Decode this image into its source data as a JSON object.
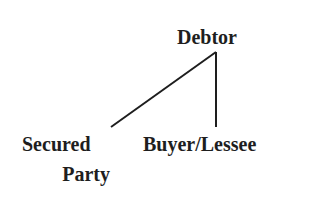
{
  "diagram": {
    "type": "tree",
    "root": {
      "label": "Debtor"
    },
    "children": [
      {
        "label_line1": "Secured",
        "label_line2": "Party"
      },
      {
        "label": "Buyer/Lessee"
      }
    ],
    "edges": [
      {
        "from": "Debtor",
        "to": "Secured Party"
      },
      {
        "from": "Debtor",
        "to": "Buyer/Lessee"
      }
    ],
    "colors": {
      "text": "#1e1e1e",
      "line": "#1e1e1e",
      "background": "#ffffff"
    }
  }
}
